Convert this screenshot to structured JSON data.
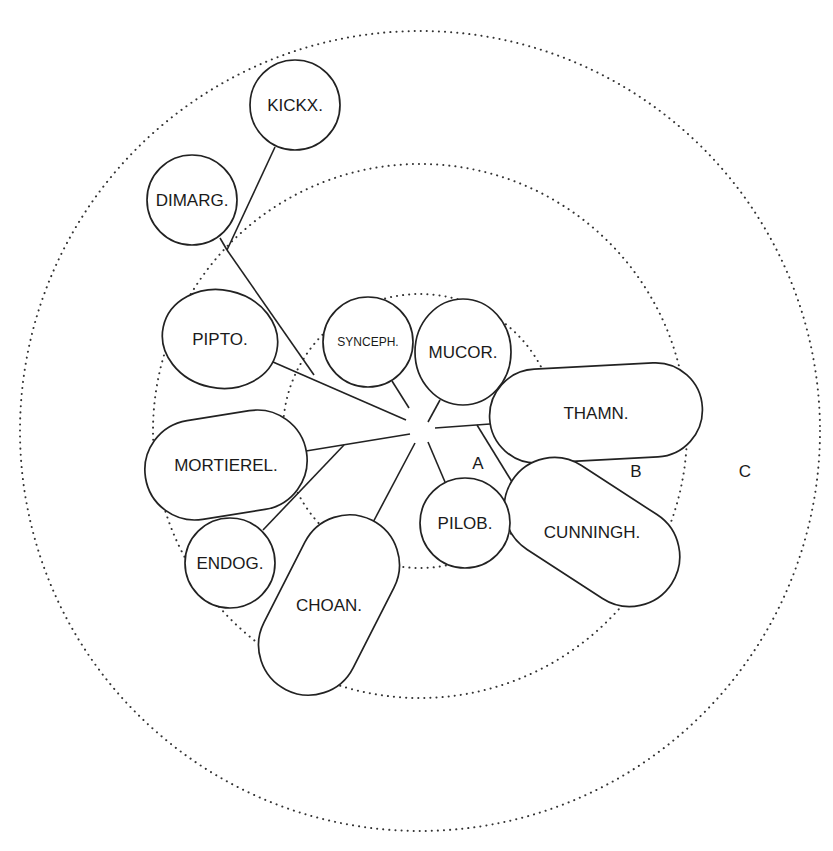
{
  "diagram": {
    "zones": [
      {
        "id": "A",
        "label": "A",
        "cx": 420,
        "cy": 431,
        "r": 137,
        "label_pos": [
          478,
          463
        ]
      },
      {
        "id": "B",
        "label": "B",
        "cx": 420,
        "cy": 431,
        "r": 267,
        "label_pos": [
          636,
          471
        ]
      },
      {
        "id": "C",
        "label": "C",
        "cx": 420,
        "cy": 431,
        "r": 400,
        "label_pos": [
          745,
          471
        ]
      }
    ],
    "nodes": [
      {
        "id": "kickx",
        "label": "KICKX.",
        "shape": "circle",
        "cx": 295,
        "cy": 105,
        "r": 45,
        "font_size": 17
      },
      {
        "id": "dimarg",
        "label": "DIMARG.",
        "shape": "circle",
        "cx": 192,
        "cy": 200,
        "r": 45,
        "font_size": 17
      },
      {
        "id": "pipto",
        "label": "PIPTO.",
        "shape": "ellipse",
        "cx": 220,
        "cy": 339,
        "rx": 58,
        "ry": 49,
        "rotate": 12,
        "font_size": 17
      },
      {
        "id": "synceph",
        "label": "SYNCEPH.",
        "shape": "circle",
        "cx": 368,
        "cy": 342,
        "r": 45,
        "font_size": 12
      },
      {
        "id": "mucor",
        "label": "MUCOR.",
        "shape": "ellipse",
        "cx": 463,
        "cy": 352,
        "rx": 48,
        "ry": 53,
        "rotate": 0,
        "font_size": 17
      },
      {
        "id": "thamn",
        "label": "THAMN.",
        "shape": "capsule",
        "cx": 596,
        "cy": 413,
        "length": 213,
        "width": 94,
        "rotate": -3,
        "font_size": 17
      },
      {
        "id": "cunningh",
        "label": "CUNNINGH.",
        "shape": "capsule",
        "cx": 592,
        "cy": 532,
        "length": 190,
        "width": 100,
        "rotate": 33,
        "text_rotate": -33,
        "font_size": 17
      },
      {
        "id": "pilob",
        "label": "PILOB.",
        "shape": "circle",
        "cx": 465,
        "cy": 523,
        "r": 45,
        "font_size": 17
      },
      {
        "id": "mortierel",
        "label": "MORTIEREL.",
        "shape": "capsule",
        "cx": 226,
        "cy": 465,
        "length": 163,
        "width": 100,
        "rotate": -9,
        "text_rotate": 9,
        "font_size": 17
      },
      {
        "id": "endog",
        "label": "ENDOG.",
        "shape": "circle",
        "cx": 230,
        "cy": 563,
        "r": 45,
        "font_size": 17
      },
      {
        "id": "choan",
        "label": "CHOAN.",
        "shape": "capsule",
        "cx": 329,
        "cy": 605,
        "length": 190,
        "width": 100,
        "rotate": -63,
        "text_rotate": 63,
        "font_size": 17
      }
    ],
    "edges": [
      {
        "from": "kickx",
        "x1": 275,
        "y1": 147,
        "x2": 227,
        "y2": 250
      },
      {
        "from": "dimarg",
        "x1": 220,
        "y1": 238,
        "x2": 227,
        "y2": 250
      },
      {
        "from": "dimarg-kickx-join",
        "x1": 227,
        "y1": 250,
        "x2": 314,
        "y2": 375
      },
      {
        "from": "pipto",
        "x1": 273,
        "y1": 362,
        "x2": 406,
        "y2": 420
      },
      {
        "from": "synceph",
        "x1": 392,
        "y1": 381,
        "x2": 409,
        "y2": 408
      },
      {
        "from": "mucor",
        "x1": 440,
        "y1": 400,
        "x2": 428,
        "y2": 422
      },
      {
        "from": "thamn",
        "x1": 435,
        "y1": 428,
        "x2": 490,
        "y2": 424
      },
      {
        "from": "cunningh",
        "x1": 477,
        "y1": 425,
        "x2": 517,
        "y2": 490
      },
      {
        "from": "thamn-cunningh-tick",
        "x1": 550,
        "y1": 461,
        "x2": 550,
        "y2": 467
      },
      {
        "from": "pilob",
        "x1": 428,
        "y1": 442,
        "x2": 445,
        "y2": 482
      },
      {
        "from": "mortierel",
        "x1": 306,
        "y1": 451,
        "x2": 410,
        "y2": 434
      },
      {
        "from": "endog",
        "x1": 263,
        "y1": 530,
        "x2": 344,
        "y2": 445
      },
      {
        "from": "choan",
        "x1": 370,
        "y1": 528,
        "x2": 415,
        "y2": 443
      }
    ],
    "hub": {
      "cx": 423,
      "cy": 432
    }
  }
}
